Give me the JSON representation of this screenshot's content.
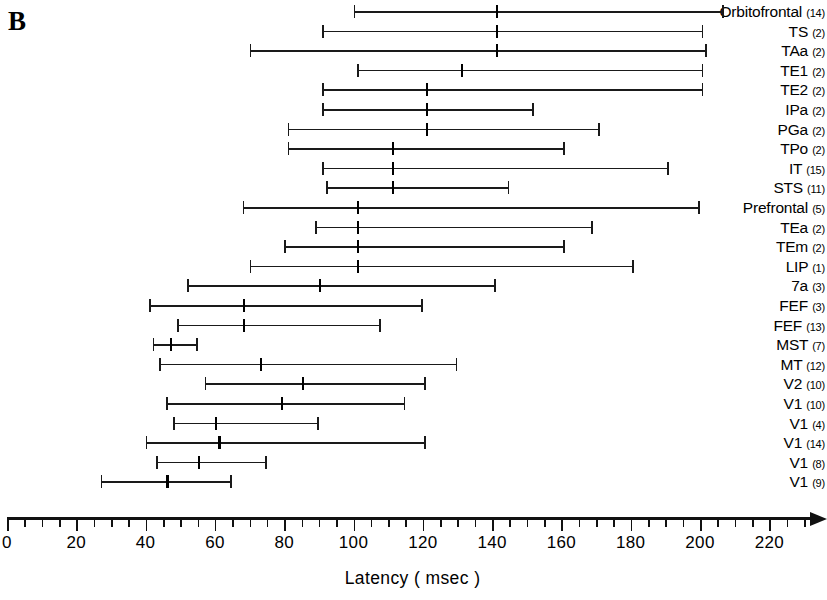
{
  "panel": {
    "letter": "B"
  },
  "chart_data": {
    "type": "range",
    "title": "",
    "xlabel": "Latency ( msec )",
    "ylabel": "",
    "xlim": [
      0,
      230
    ],
    "xticks_major": [
      0,
      20,
      40,
      60,
      80,
      100,
      120,
      140,
      160,
      180,
      200,
      220
    ],
    "xtick_labels": [
      "0",
      "20",
      "40",
      "60",
      "80",
      "100",
      "120",
      "140",
      "160",
      "180",
      "200",
      "220"
    ],
    "xticks_minor_step": 5,
    "grid": false,
    "legend": null,
    "value_units": "msec",
    "rows": [
      {
        "area": "Orbitofrontal",
        "n": "(14)",
        "min": 100,
        "median": 141,
        "max": 207
      },
      {
        "area": "TS",
        "n": "(2)",
        "min": 91,
        "median": 141,
        "max": 201
      },
      {
        "area": "TAa",
        "n": "(2)",
        "min": 70,
        "median": 141,
        "max": 202
      },
      {
        "area": "TE1",
        "n": "(2)",
        "min": 101,
        "median": 131,
        "max": 201
      },
      {
        "area": "TE2",
        "n": "(2)",
        "min": 91,
        "median": 121,
        "max": 201
      },
      {
        "area": "IPa",
        "n": "(2)",
        "min": 91,
        "median": 121,
        "max": 152
      },
      {
        "area": "PGa",
        "n": "(2)",
        "min": 81,
        "median": 121,
        "max": 171
      },
      {
        "area": "TPo",
        "n": "(2)",
        "min": 81,
        "median": 111,
        "max": 161
      },
      {
        "area": "IT",
        "n": "(15)",
        "min": 91,
        "median": 111,
        "max": 191
      },
      {
        "area": "STS",
        "n": "(11)",
        "min": 92,
        "median": 111,
        "max": 145
      },
      {
        "area": "Prefrontal",
        "n": "(5)",
        "min": 68,
        "median": 101,
        "max": 200
      },
      {
        "area": "TEa",
        "n": "(2)",
        "min": 89,
        "median": 101,
        "max": 169
      },
      {
        "area": "TEm",
        "n": "(2)",
        "min": 80,
        "median": 101,
        "max": 161
      },
      {
        "area": "LIP",
        "n": "(1)",
        "min": 70,
        "median": 101,
        "max": 181
      },
      {
        "area": "7a",
        "n": "(3)",
        "min": 52,
        "median": 90,
        "max": 141
      },
      {
        "area": "FEF",
        "n": "(3)",
        "min": 41,
        "median": 68,
        "max": 120
      },
      {
        "area": "FEF",
        "n": "(13)",
        "min": 49,
        "median": 68,
        "max": 108
      },
      {
        "area": "MST",
        "n": "(7)",
        "min": 42,
        "median": 47,
        "max": 55
      },
      {
        "area": "MT",
        "n": "(12)",
        "min": 44,
        "median": 73,
        "max": 130
      },
      {
        "area": "V2",
        "n": "(10)",
        "min": 57,
        "median": 85,
        "max": 121
      },
      {
        "area": "V1",
        "n": "(10)",
        "min": 46,
        "median": 79,
        "max": 115
      },
      {
        "area": "V1",
        "n": "(4)",
        "min": 48,
        "median": 60,
        "max": 90
      },
      {
        "area": "V1",
        "n": "(14)",
        "min": 40,
        "median": 61,
        "max": 121
      },
      {
        "area": "V1",
        "n": "(8)",
        "min": 43,
        "median": 55,
        "max": 75
      },
      {
        "area": "V1",
        "n": "(9)",
        "min": 27,
        "median": 46,
        "max": 65
      }
    ]
  },
  "colors": {
    "ink": "#111111",
    "line": "#1a1a1a",
    "background": "#ffffff"
  }
}
